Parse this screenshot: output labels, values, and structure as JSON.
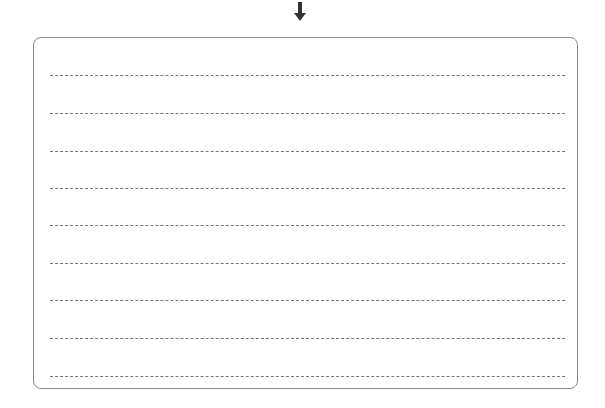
{
  "arrow": {
    "icon": "arrow-down-icon",
    "color": "#333333"
  },
  "writing_box": {
    "border_color": "#8a8a8a",
    "line_color": "#777777",
    "line_count": 9,
    "lines": [
      {
        "text": ""
      },
      {
        "text": ""
      },
      {
        "text": ""
      },
      {
        "text": ""
      },
      {
        "text": ""
      },
      {
        "text": ""
      },
      {
        "text": ""
      },
      {
        "text": ""
      },
      {
        "text": ""
      }
    ]
  }
}
